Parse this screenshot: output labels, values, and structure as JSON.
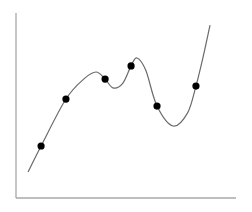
{
  "chart_data": {
    "type": "scatter",
    "title": "",
    "xlabel": "",
    "ylabel": "",
    "xlim": [
      0,
      10
    ],
    "ylim": [
      0,
      10
    ],
    "grid": false,
    "legend": "none",
    "tick_labels": {
      "x": [],
      "y": []
    },
    "series": [
      {
        "name": "data points",
        "kind": "scatter",
        "color": "#000000",
        "x": [
          1.14,
          2.27,
          4.05,
          5.23,
          6.41,
          8.18
        ],
        "y": [
          2.81,
          5.35,
          6.43,
          7.14,
          4.97,
          6.05
        ]
      },
      {
        "name": "fitted curve",
        "kind": "line",
        "color": "#6a6a6a",
        "x": [
          0.55,
          1.14,
          2.27,
          3.1,
          3.64,
          4.05,
          4.41,
          4.85,
          5.23,
          5.5,
          5.9,
          6.41,
          7.14,
          7.8,
          8.18,
          8.5,
          8.82
        ],
        "y": [
          1.41,
          2.81,
          5.35,
          6.45,
          6.81,
          6.43,
          5.95,
          6.2,
          7.14,
          7.57,
          6.9,
          4.97,
          3.89,
          4.6,
          6.05,
          7.6,
          9.35
        ]
      }
    ]
  }
}
